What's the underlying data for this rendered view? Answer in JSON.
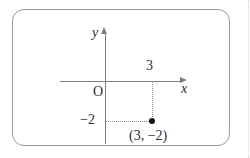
{
  "figure": {
    "frame_color": "#9a9a9a",
    "axis_color": "#7d7d7d",
    "guide_color": "#8f8f8f",
    "point_color": "#111111",
    "text_color": "#2e2e2e",
    "background": "#ffffff"
  },
  "axes": {
    "x_axis_label": "x",
    "y_axis_label": "y",
    "origin_label": "O"
  },
  "ticks": {
    "x_tick_label": "3",
    "y_tick_label": "−2"
  },
  "point": {
    "coordinate_label": "(3, −2)",
    "x": 3,
    "y": -2
  },
  "chart_data": {
    "type": "scatter",
    "title": "",
    "xlabel": "x",
    "ylabel": "y",
    "grid": false,
    "legend": "none",
    "origin_label": "O",
    "xlim": [
      -3,
      5
    ],
    "ylim": [
      -4,
      3
    ],
    "x_ticks": [
      3
    ],
    "x_tick_labels": [
      "3"
    ],
    "y_ticks": [
      -2
    ],
    "y_tick_labels": [
      "−2"
    ],
    "series": [
      {
        "name": "plotted-point",
        "x": [
          3
        ],
        "y": [
          -2
        ],
        "labels": [
          "(3, −2)"
        ],
        "marker": "filled-circle",
        "color": "#111111"
      }
    ],
    "annotations": [
      {
        "text": "3",
        "kind": "x-tick-label",
        "x": 3,
        "y": 0
      },
      {
        "text": "−2",
        "kind": "y-tick-label",
        "x": 0,
        "y": -2
      },
      {
        "text": "(3, −2)",
        "kind": "point-label",
        "x": 3,
        "y": -2
      },
      {
        "text": "O",
        "kind": "origin-label",
        "x": 0,
        "y": 0
      }
    ],
    "guides": [
      {
        "kind": "vertical-dotted",
        "from": [
          3,
          0
        ],
        "to": [
          3,
          -2
        ]
      },
      {
        "kind": "horizontal-dotted",
        "from": [
          0,
          -2
        ],
        "to": [
          3,
          -2
        ]
      }
    ]
  }
}
